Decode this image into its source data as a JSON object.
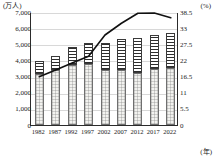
{
  "chart_data": {
    "type": "bar",
    "title": "",
    "subtitle": "",
    "xlabel": "(年)",
    "ylabel": "(万人)",
    "y2label": "(%)",
    "categories": [
      "1982",
      "1987",
      "1992",
      "1997",
      "2002",
      "2007",
      "2012",
      "2017",
      "2022"
    ],
    "ylim": [
      0,
      7000
    ],
    "y2lim": [
      0,
      38.5
    ],
    "yticks": [
      "0",
      "1,000",
      "2,000",
      "3,000",
      "4,000",
      "5,000",
      "6,000",
      "7,000"
    ],
    "ytick_values": [
      0,
      1000,
      2000,
      3000,
      4000,
      5000,
      6000,
      7000
    ],
    "y2ticks": [
      "0",
      "5.5",
      "11",
      "16.5",
      "22",
      "27.5",
      "33",
      "38.5"
    ],
    "y2tick_values": [
      0,
      5.5,
      11,
      16.5,
      22,
      27.5,
      33,
      38.5
    ],
    "grid": true,
    "legend": "none",
    "stacked": true,
    "series": [
      {
        "name": "lower-segment",
        "axis": "left",
        "pattern": "dotted-light",
        "values": [
          3150,
          3400,
          3700,
          3760,
          3400,
          3380,
          3230,
          3480,
          3560
        ]
      },
      {
        "name": "upper-segment",
        "axis": "left",
        "pattern": "horizontal-stripes",
        "values": [
          830,
          880,
          1120,
          1320,
          1660,
          1930,
          2130,
          2120,
          2130
        ]
      },
      {
        "name": "bar-total",
        "axis": "left",
        "values": [
          3980,
          4280,
          4820,
          5080,
          5060,
          5310,
          5360,
          5600,
          5690
        ]
      },
      {
        "name": "ratio-line",
        "axis": "right",
        "type": "line",
        "values": [
          16.8,
          19.1,
          21.5,
          23.8,
          31.0,
          35.0,
          38.4,
          38.5,
          36.9
        ]
      }
    ]
  }
}
